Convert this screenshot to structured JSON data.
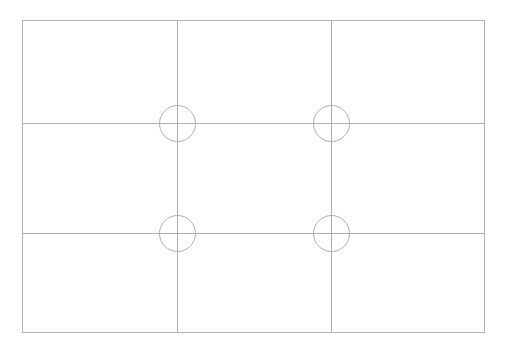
{
  "canvas": {
    "width": 508,
    "height": 353,
    "background_color": "#ffffff"
  },
  "diagram": {
    "name": "rule-of-thirds-composition-grid",
    "stroke_color": "#aeaeae",
    "stroke_color_frame": "#b4b4b4",
    "stroke_width": 1,
    "frame": {
      "x": 22,
      "y": 20,
      "width": 463,
      "height": 313
    },
    "grid": {
      "columns": 3,
      "rows": 3,
      "vertical_lines_x": [
        177,
        331
      ],
      "horizontal_lines_y": [
        123,
        233
      ]
    },
    "markers": {
      "type": "circle-crosshair",
      "radius": 18,
      "crosshair_overhang": 8,
      "count": 4,
      "centers": [
        {
          "label": "top-left-intersection",
          "cx": 177,
          "cy": 123
        },
        {
          "label": "top-right-intersection",
          "cx": 331,
          "cy": 123
        },
        {
          "label": "bottom-left-intersection",
          "cx": 177,
          "cy": 233
        },
        {
          "label": "bottom-right-intersection",
          "cx": 331,
          "cy": 233
        }
      ]
    }
  }
}
